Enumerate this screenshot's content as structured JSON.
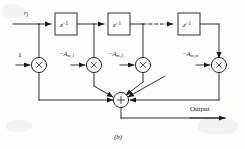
{
  "figure": {
    "caption": "(b)",
    "input_label": "r",
    "input_label_sub": "j",
    "gain_one_label": "1",
    "output_label": "Output",
    "delay_label_base": "z",
    "delay_label_exp": "−1",
    "sum_symbol": "+",
    "mult_symbol": "×",
    "delays": [
      {
        "name": "delay-1",
        "label_base": "z",
        "label_exp": "−1"
      },
      {
        "name": "delay-2",
        "label_base": "z",
        "label_exp": "−1"
      },
      {
        "name": "delay-m",
        "label_base": "z",
        "label_exp": "−1"
      }
    ],
    "coefficients": [
      {
        "name": "coef-1",
        "prefix": "−A",
        "sub": "m,1"
      },
      {
        "name": "coef-2",
        "prefix": "−A",
        "sub": "m,2"
      },
      {
        "name": "coef-m",
        "prefix": "−A",
        "sub": "m,m"
      }
    ],
    "colors": {
      "line": "#1a1a1a",
      "background": "#fdfdfc",
      "text": "#1a1a1a"
    }
  }
}
